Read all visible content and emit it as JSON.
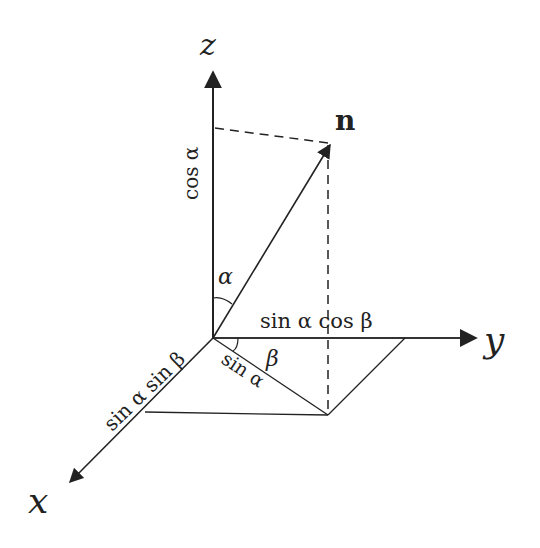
{
  "diagram": {
    "axes": {
      "z": {
        "label": "z"
      },
      "y": {
        "label": "y"
      },
      "x": {
        "label": "x"
      }
    },
    "vector": {
      "label": "n"
    },
    "angles": {
      "alpha": "α",
      "beta": "β"
    },
    "components": {
      "z_component": "cos α",
      "y_component": "sin α cos β",
      "x_component": "sin α sin β",
      "projection": "sin α"
    },
    "colors": {
      "ink": "#222222",
      "background": "#ffffff"
    }
  }
}
